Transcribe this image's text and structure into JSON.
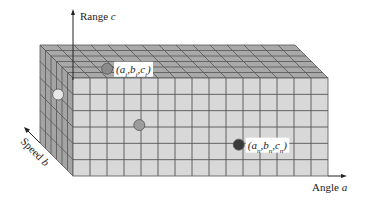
{
  "figure": {
    "axes": {
      "range": {
        "label": "Range ",
        "var": "c"
      },
      "angle": {
        "label": "Angle ",
        "var": "a"
      },
      "speed": {
        "label": "Speed ",
        "var": "b"
      }
    },
    "grid": {
      "angle_cells": 15,
      "range_cells": 6,
      "speed_cells": 6
    },
    "colors": {
      "front_face": "#d8d8d8",
      "top_face": "#a9a9a9",
      "side_face": "#a4a4a4",
      "grid_line": "#555555",
      "point_top": "#8a8a8a",
      "point_mid": "#9c9c9c",
      "point_side": "#e6e6e6",
      "point_front": "#3a3a3a"
    },
    "points": [
      {
        "name": "point-i",
        "label_parts": [
          [
            "(a",
            ""
          ],
          [
            "i",
            "sub"
          ],
          [
            ",b",
            ""
          ],
          [
            "i",
            "sub"
          ],
          [
            ",c",
            ""
          ],
          [
            "i",
            "sub"
          ],
          [
            ")",
            ""
          ]
        ],
        "face": "top",
        "u": 0.17,
        "v": 0.72,
        "fill_key": "point_top"
      },
      {
        "name": "point-mid",
        "label_parts": [],
        "face": "front",
        "u": 0.26,
        "v": 0.48,
        "fill_key": "point_mid"
      },
      {
        "name": "point-side",
        "label_parts": [],
        "face": "side",
        "u": 0.55,
        "v": 0.32,
        "fill_key": "point_side"
      },
      {
        "name": "point-n",
        "label_parts": [
          [
            "(a",
            ""
          ],
          [
            "n",
            "sub"
          ],
          [
            ",b",
            ""
          ],
          [
            "n",
            "sub"
          ],
          [
            ",c",
            ""
          ],
          [
            "n",
            "sub"
          ],
          [
            ")",
            ""
          ]
        ],
        "face": "front",
        "u": 0.65,
        "v": 0.68,
        "fill_key": "point_front"
      }
    ]
  }
}
